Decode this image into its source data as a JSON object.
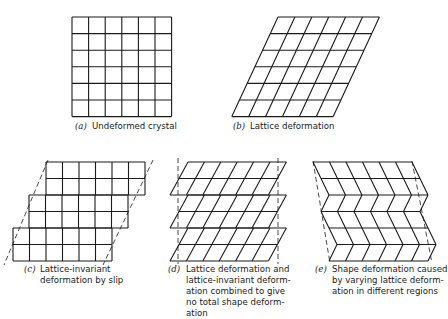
{
  "figure": {
    "stroke_color": "#1a1a1a",
    "panels": [
      {
        "id": "a",
        "label": "(a)",
        "caption": [
          "Undeformed crystal"
        ],
        "type": "square-grid",
        "origin": [
          72,
          17
        ],
        "cell": 16.6,
        "cols": 6,
        "rows": 6
      },
      {
        "id": "b",
        "label": "(b)",
        "caption": [
          "Lattice deformation"
        ],
        "type": "sheared-grid",
        "top_left": [
          278,
          17
        ],
        "cell_w": 16.9,
        "row_h": 16.6,
        "cols": 6,
        "rows": 6,
        "shear_per_row": -7.7
      },
      {
        "id": "c",
        "label": "(c)",
        "caption": [
          "Lattice-invariant",
          "deformation by slip"
        ],
        "type": "slip-steps",
        "block_left_x": [
          46,
          29,
          13
        ],
        "top_y": 162,
        "cell": 16.5,
        "cols": 6,
        "rows_per_block": 2,
        "dashed_lines": [
          [
            [
              48,
              160
            ],
            [
              4,
              265
            ]
          ],
          [
            [
              153,
              160
            ],
            [
              103,
              265
            ]
          ]
        ]
      },
      {
        "id": "d",
        "label": "(d)",
        "caption": [
          "Lattice deformation and",
          "lattice-invariant deform-",
          "ation combined to give",
          "no total shape deform-",
          "ation"
        ],
        "type": "sheared-blocks",
        "block_top_left_x": 188,
        "top_y": 162,
        "cell_w": 16.4,
        "row_h": 16.5,
        "cols": 6,
        "blocks": 3,
        "rows_per_block": 2,
        "shear_per_row": -9,
        "dashed_lines": [
          [
            [
              178,
              158
            ],
            [
              178,
              264
            ]
          ],
          [
            [
              278,
              158
            ],
            [
              278,
              264
            ]
          ]
        ]
      },
      {
        "id": "e",
        "label": "(e)",
        "caption": [
          "Shape deformation caused",
          "by varying lattice deform-",
          "ation in different regions"
        ],
        "type": "zigzag",
        "row_y": [
          162,
          178.5,
          195,
          211.5,
          228,
          244.5,
          261
        ],
        "left_x": [
          313,
          321,
          329,
          321,
          329,
          337,
          329
        ],
        "cell_w": 16.5,
        "cols": 6,
        "dashed_lines": [
          [
            [
              313,
              161
            ],
            [
              330,
              263
            ]
          ],
          [
            [
              412,
              161
            ],
            [
              432,
              263
            ]
          ]
        ]
      }
    ]
  }
}
